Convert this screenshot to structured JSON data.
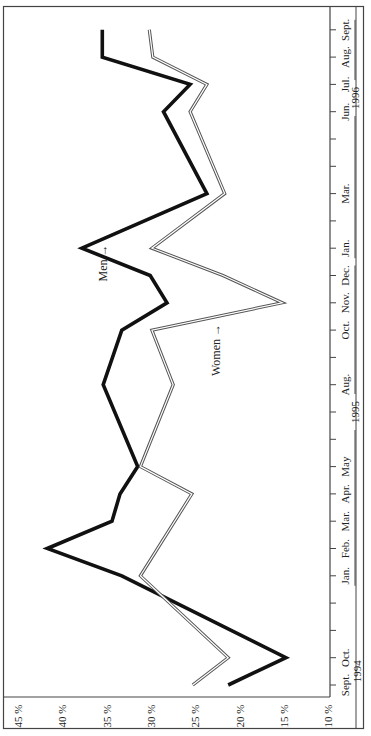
{
  "chart_data": {
    "type": "line",
    "orientation": "rotated-90-ccw",
    "title": "",
    "xlabel": "",
    "ylabel": "",
    "ylim": [
      10,
      45
    ],
    "y_ticks": [
      "45 %",
      "40 %",
      "35 %",
      "30 %",
      "25 %",
      "20 %",
      "15 %",
      "10 %"
    ],
    "y_tick_values": [
      45,
      40,
      35,
      30,
      25,
      20,
      15,
      10
    ],
    "grid": false,
    "x": [
      "Sept. 1994",
      "Oct. 1994",
      "Nov. 1994",
      "Dec. 1994",
      "Jan. 1995",
      "Feb. 1995",
      "Mar. 1995",
      "Apr. 1995",
      "May 1995",
      "Jun. 1995",
      "Jul. 1995",
      "Aug. 1995",
      "Sept. 1995",
      "Oct. 1995",
      "Nov. 1995",
      "Dec. 1995",
      "Jan. 1996",
      "Feb. 1996",
      "Mar. 1996",
      "Apr. 1996",
      "May 1996",
      "Jun. 1996",
      "Jul. 1996",
      "Aug. 1996",
      "Sept. 1996"
    ],
    "x_tick_labels": [
      {
        "index": 0,
        "label": "Sept."
      },
      {
        "index": 1,
        "label": "Oct."
      },
      {
        "index": 4,
        "label": "Jan."
      },
      {
        "index": 5,
        "label": "Feb."
      },
      {
        "index": 6,
        "label": "Mar."
      },
      {
        "index": 7,
        "label": "Apr."
      },
      {
        "index": 8,
        "label": "May"
      },
      {
        "index": 11,
        "label": "Aug."
      },
      {
        "index": 13,
        "label": "Oct."
      },
      {
        "index": 14,
        "label": "Nov."
      },
      {
        "index": 15,
        "label": "Dec."
      },
      {
        "index": 16,
        "label": "Jan."
      },
      {
        "index": 18,
        "label": "Mar."
      },
      {
        "index": 21,
        "label": "Jun."
      },
      {
        "index": 22,
        "label": "Jul."
      },
      {
        "index": 23,
        "label": "Aug."
      },
      {
        "index": 24,
        "label": "Sept."
      }
    ],
    "year_labels": [
      {
        "label": "1994",
        "center_index": 0.5,
        "bracket": false
      },
      {
        "label": "1995",
        "from_index": 4,
        "to_index": 15,
        "center_index": 10,
        "bracket": true
      },
      {
        "label": "1996",
        "from_index": 16,
        "to_index": 24,
        "center_index": 21.5,
        "bracket": true
      }
    ],
    "series": [
      {
        "name": "Men",
        "style": "thick-solid",
        "color": "#111111",
        "values": [
          21.3,
          14.8,
          null,
          null,
          33.3,
          41.7,
          34.4,
          33.5,
          31.5,
          null,
          null,
          35.4,
          null,
          33.3,
          28.2,
          30.1,
          37.8,
          null,
          23.7,
          null,
          null,
          28.6,
          25.6,
          35.5,
          35.5
        ]
      },
      {
        "name": "Women",
        "style": "double-line",
        "color": "#555555",
        "values": [
          25.3,
          21.3,
          null,
          null,
          31.2,
          null,
          null,
          25.4,
          31.2,
          null,
          null,
          27.5,
          null,
          29.9,
          15.2,
          21.9,
          29.9,
          null,
          21.7,
          null,
          null,
          25.6,
          23.7,
          29.8,
          30.2
        ]
      }
    ],
    "annotations": [
      {
        "text": "Men",
        "arrow": "→",
        "series": "Men",
        "near_index": 15.5
      },
      {
        "text": "Women",
        "arrow": "→",
        "series": "Women",
        "near_index": 12.7
      }
    ],
    "legend": "inline annotations"
  }
}
